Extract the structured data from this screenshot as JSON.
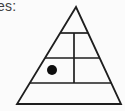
{
  "page": {
    "background_color": "#fbfbfb"
  },
  "label": {
    "text": "es:"
  },
  "diagram": {
    "type": "pyramid",
    "line_color": "#1e1e1e",
    "dot_color": "#0d0d0d",
    "levels": [
      {
        "name": "level-1-apex",
        "cells": 1
      },
      {
        "name": "level-2",
        "cells": 2
      },
      {
        "name": "level-3",
        "cells": 2,
        "marker": "filled-dot-in-left-cell"
      },
      {
        "name": "level-4-base",
        "cells": 1
      }
    ]
  }
}
